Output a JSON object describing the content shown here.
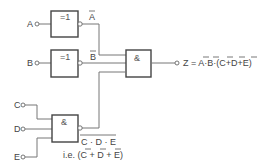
{
  "diagram": {
    "inputs": [
      "A",
      "B",
      "C",
      "D",
      "E"
    ],
    "gates": [
      {
        "id": "not-a",
        "symbol": "=1",
        "output_label": "A",
        "output_overline": true
      },
      {
        "id": "not-b",
        "symbol": "=1",
        "output_label": "B",
        "output_overline": true
      },
      {
        "id": "and-final",
        "symbol": "&"
      },
      {
        "id": "nand-cde",
        "symbol": "&"
      }
    ],
    "output": {
      "prefix": "Z = ",
      "term_a": "A",
      "dot1": "·",
      "term_b": "B",
      "dot2": "·(",
      "term_c": "C",
      "plus1": "+",
      "term_d": "D",
      "plus2": "+",
      "term_e": "E",
      "close": ")"
    },
    "nand_annotation": {
      "line1": "C · D · E",
      "ie_prefix": "i.e. (",
      "c": "C",
      "p1": " + ",
      "d": "D",
      "p2": " + ",
      "e": "E",
      "close": ")"
    }
  }
}
